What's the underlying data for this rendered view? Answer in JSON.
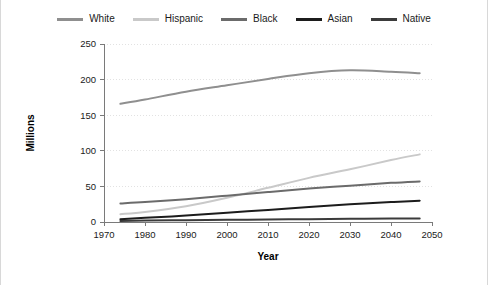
{
  "chart_data": {
    "type": "line",
    "title": "",
    "xlabel": "Year",
    "ylabel": "Millions",
    "xlim": [
      1970,
      2050
    ],
    "ylim": [
      0,
      250
    ],
    "grid": true,
    "legend_position": "top",
    "x_ticks": [
      "1970",
      "1980",
      "1990",
      "2000",
      "2010",
      "2020",
      "2030",
      "2040",
      "2050"
    ],
    "y_ticks": [
      "0",
      "50",
      "100",
      "150",
      "200",
      "250"
    ],
    "x": [
      1974,
      1980,
      1990,
      2000,
      2010,
      2020,
      2030,
      2040,
      2047
    ],
    "series": [
      {
        "name": "White",
        "color": "#8f8f8f",
        "values": [
          166,
          172,
          183,
          192,
          201,
          209,
          213,
          211,
          209
        ]
      },
      {
        "name": "Hispanic",
        "color": "#c9c9c9",
        "values": [
          11,
          14,
          22,
          34,
          48,
          62,
          74,
          87,
          95
        ]
      },
      {
        "name": "Black",
        "color": "#6b6b6b",
        "values": [
          26,
          28,
          32,
          37,
          42,
          47,
          51,
          55,
          57
        ]
      },
      {
        "name": "Asian",
        "color": "#1c1c1c",
        "values": [
          4,
          6,
          9,
          13,
          17,
          21,
          25,
          28,
          30
        ]
      },
      {
        "name": "Native",
        "color": "#3b3b3b",
        "values": [
          1.5,
          2,
          2.5,
          3,
          3.5,
          4,
          4.5,
          5,
          5
        ]
      }
    ]
  },
  "legend": {
    "items": [
      {
        "label": "White"
      },
      {
        "label": "Hispanic"
      },
      {
        "label": "Black"
      },
      {
        "label": "Asian"
      },
      {
        "label": "Native"
      }
    ]
  },
  "axes": {
    "y_title": "Millions",
    "x_title": "Year"
  }
}
